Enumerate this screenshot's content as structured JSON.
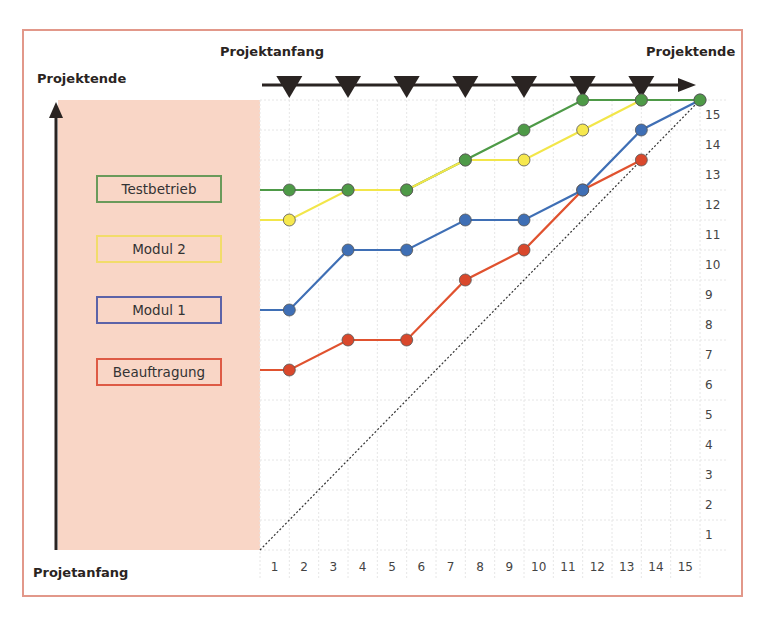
{
  "chart_data": {
    "type": "line",
    "title": "",
    "labels": {
      "top_left": "Projektanfang",
      "top_right": "Projektende",
      "left_top": "Projektende",
      "left_bottom": "Projetanfang"
    },
    "x_ticks": [
      "1",
      "2",
      "3",
      "4",
      "5",
      "6",
      "7",
      "8",
      "9",
      "10",
      "11",
      "12",
      "13",
      "14",
      "15"
    ],
    "y_ticks": [
      "15",
      "14",
      "13",
      "12",
      "11",
      "10",
      "9",
      "8",
      "7",
      "6",
      "5",
      "4",
      "3",
      "2",
      "1"
    ],
    "milestone_markers_x": [
      1,
      3,
      5,
      7,
      9,
      11,
      13
    ],
    "grid": true,
    "diagonal_reference": {
      "from": [
        0,
        0
      ],
      "to": [
        15,
        15
      ],
      "style": "dotted"
    },
    "legend_position": "left",
    "series": [
      {
        "name": "Testbetrieb",
        "color": "#4e9a47",
        "fill": "#4e9a47",
        "x": [
          1,
          3,
          5,
          7,
          9,
          11,
          13,
          15
        ],
        "y": [
          12,
          12,
          12,
          13,
          14,
          15,
          15,
          15
        ],
        "start_y": 12
      },
      {
        "name": "Modul 2",
        "color": "#f2e64a",
        "fill": "#f6e84e",
        "x": [
          1,
          3,
          5,
          7,
          9,
          11,
          13
        ],
        "y": [
          11,
          12,
          12,
          13,
          13,
          14,
          15
        ],
        "start_y": 11
      },
      {
        "name": "Modul 1",
        "color": "#3f6fb5",
        "fill": "#3f6fb5",
        "x": [
          1,
          3,
          5,
          7,
          9,
          11,
          13,
          15
        ],
        "y": [
          8,
          10,
          10,
          11,
          11,
          12,
          14,
          15
        ],
        "start_y": 8
      },
      {
        "name": "Beauftragung",
        "color": "#e0522f",
        "fill": "#d9482c",
        "x": [
          1,
          3,
          5,
          7,
          9,
          11,
          13
        ],
        "y": [
          6,
          7,
          7,
          9,
          10,
          12,
          13
        ],
        "start_y": 6
      }
    ]
  },
  "legend": {
    "items": [
      {
        "label": "Testbetrieb",
        "color": "#6a9a5a"
      },
      {
        "label": "Modul 2",
        "color": "#f2dc6a"
      },
      {
        "label": "Modul 1",
        "color": "#5c63a8"
      },
      {
        "label": "Beauftragung",
        "color": "#de5a44"
      }
    ]
  },
  "colors": {
    "frame_border": "#e2988a",
    "panel_bg": "#f9d6c6",
    "axis": "#2a2422"
  }
}
